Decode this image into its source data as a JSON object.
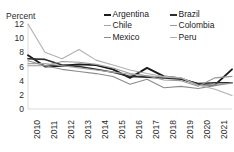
{
  "chart_data": {
    "type": "line",
    "title": "",
    "xlabel": "",
    "ylabel": "Percent",
    "ylim": [
      0,
      12
    ],
    "yticks": [
      0,
      2,
      4,
      6,
      8,
      10,
      12
    ],
    "grid": false,
    "legend_position": "top-right",
    "legend_columns": 2,
    "x": [
      2010,
      2011,
      2012,
      2013,
      2014,
      2015,
      2016,
      2017,
      2018,
      2019,
      2020,
      2021,
      2022
    ],
    "categories": [
      "2010",
      "2011",
      "2012",
      "2013",
      "2014",
      "2015",
      "2016",
      "2017",
      "2018",
      "2019",
      "2020",
      "2021",
      "2022"
    ],
    "series": [
      {
        "name": "Argentina",
        "color": "#1a1a1a",
        "width": 1.9,
        "values": [
          7.6,
          6.0,
          6.1,
          6.3,
          6.2,
          5.6,
          4.4,
          5.8,
          4.6,
          4.3,
          3.5,
          3.4,
          5.6
        ]
      },
      {
        "name": "Brazil",
        "color": "#2e2e2e",
        "width": 1.6,
        "values": [
          7.1,
          7.0,
          6.2,
          6.0,
          5.6,
          5.2,
          4.6,
          4.5,
          4.4,
          4.2,
          3.6,
          3.7,
          3.7
        ]
      },
      {
        "name": "Chile",
        "color": "#a6a6a6",
        "width": 1.1,
        "values": [
          6.4,
          6.4,
          6.1,
          5.8,
          5.5,
          5.2,
          4.9,
          4.7,
          4.5,
          4.4,
          3.3,
          3.5,
          3.6
        ]
      },
      {
        "name": "Colombia",
        "color": "#9a9a9a",
        "width": 1.1,
        "values": [
          6.1,
          6.1,
          6.7,
          6.6,
          6.3,
          5.8,
          5.0,
          4.7,
          4.1,
          4.0,
          3.2,
          4.4,
          4.6
        ]
      },
      {
        "name": "Mexico",
        "color": "#8c8c8c",
        "width": 1.1,
        "values": [
          6.8,
          6.1,
          5.6,
          5.3,
          5.0,
          4.6,
          3.5,
          4.2,
          3.0,
          3.2,
          2.9,
          3.3,
          3.7
        ]
      },
      {
        "name": "Peru",
        "color": "#b0b0b0",
        "width": 1.1,
        "values": [
          12.0,
          8.0,
          7.1,
          8.4,
          6.9,
          6.2,
          5.5,
          5.0,
          4.6,
          4.4,
          3.4,
          2.8,
          1.9
        ]
      }
    ]
  },
  "legend": {
    "items": [
      {
        "label": "Argentina",
        "color": "#1a1a1a",
        "thickness": 2.2
      },
      {
        "label": "Brazil",
        "color": "#2e2e2e",
        "thickness": 2.0
      },
      {
        "label": "Chile",
        "color": "#a6a6a6",
        "thickness": 1.2
      },
      {
        "label": "Colombia",
        "color": "#9a9a9a",
        "thickness": 1.2
      },
      {
        "label": "Mexico",
        "color": "#8c8c8c",
        "thickness": 1.2
      },
      {
        "label": "Peru",
        "color": "#b0b0b0",
        "thickness": 1.2
      }
    ]
  },
  "axes": {
    "y_axis_title": "Percent",
    "axis_line_color": "#d0d0d0"
  }
}
